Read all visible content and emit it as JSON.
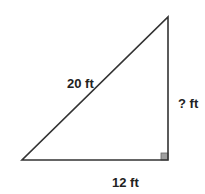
{
  "diagram": {
    "type": "right-triangle",
    "vertices": {
      "bottom_left": [
        22,
        160
      ],
      "bottom_right": [
        168,
        160
      ],
      "top": [
        168,
        17
      ]
    },
    "labels": {
      "hypotenuse": "20 ft",
      "vertical_leg": "? ft",
      "base": "12 ft"
    },
    "right_angle_marker": {
      "position": "bottom-right",
      "fill": "#a0a0a0"
    },
    "colors": {
      "stroke": "#333333",
      "background": "#ffffff"
    }
  }
}
